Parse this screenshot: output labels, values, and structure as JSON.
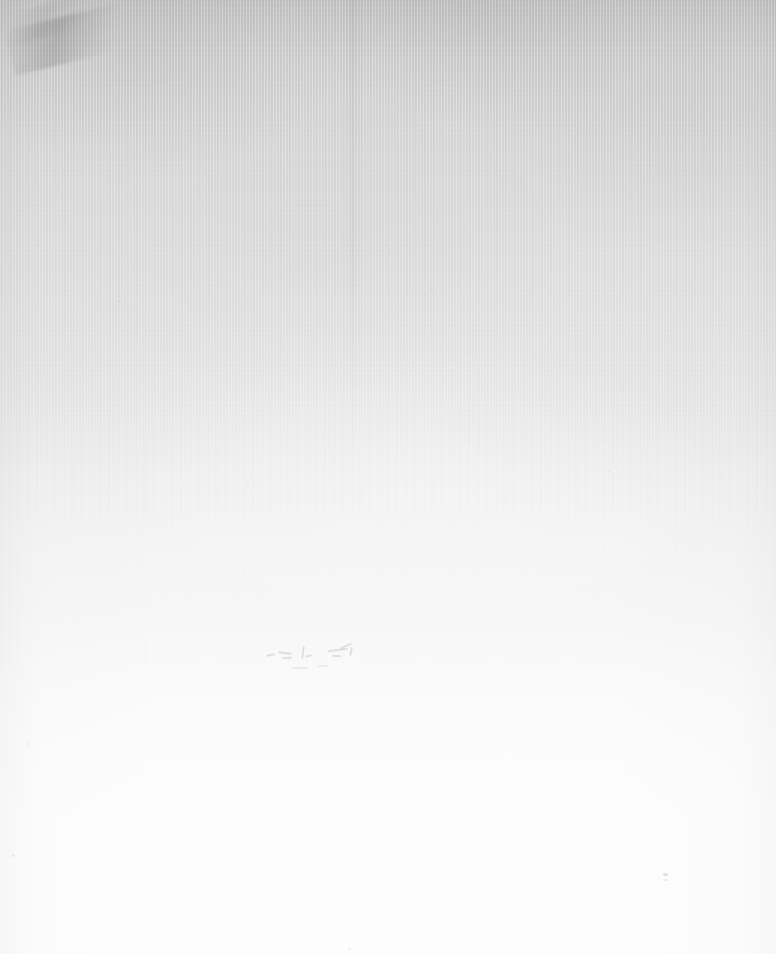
{
  "page": {
    "kind": "blank-scanned-page",
    "width": 776,
    "height": 954,
    "visible_text": "",
    "caption": ""
  },
  "colors": {
    "top_tone": "#c9c9c9",
    "upper_mid_tone": "#dcdcdc",
    "mid_tone": "#efefef",
    "lower_mid_tone": "#f6f6f6",
    "bottom_tone": "#fdfdfd",
    "background": "#ffffff"
  },
  "artifacts": {
    "scuff": {
      "name": "corner-crease",
      "label": ""
    },
    "fold": {
      "name": "vertical-fold-line",
      "label": ""
    },
    "ghosts": {
      "name": "ghost-marks",
      "label": ""
    },
    "specks": {
      "name": "dust-specks",
      "label": ""
    }
  }
}
